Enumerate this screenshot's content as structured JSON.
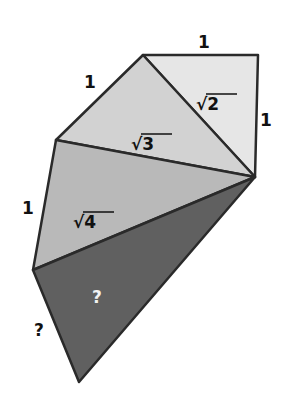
{
  "diagram": {
    "colors": {
      "tri1": "#e6e6e6",
      "tri2": "#d2d2d2",
      "tri3": "#b9b9b9",
      "tri4": "#606060",
      "stroke": "#2a2a2a"
    },
    "vertices": {
      "A": [
        143,
        55
      ],
      "B": [
        258,
        55
      ],
      "C": [
        255,
        177
      ],
      "D": [
        56,
        140
      ],
      "E": [
        33,
        270
      ],
      "F": [
        79,
        382
      ]
    },
    "labels": {
      "top_side": "1",
      "right_side": "1",
      "upper_left_side": "1",
      "left_side": "1",
      "hyp_sqrt2": "√2",
      "hyp_sqrt3": "√3",
      "hyp_sqrt4": "√4",
      "unknown_side": "?",
      "unknown_triangle": "?"
    }
  }
}
